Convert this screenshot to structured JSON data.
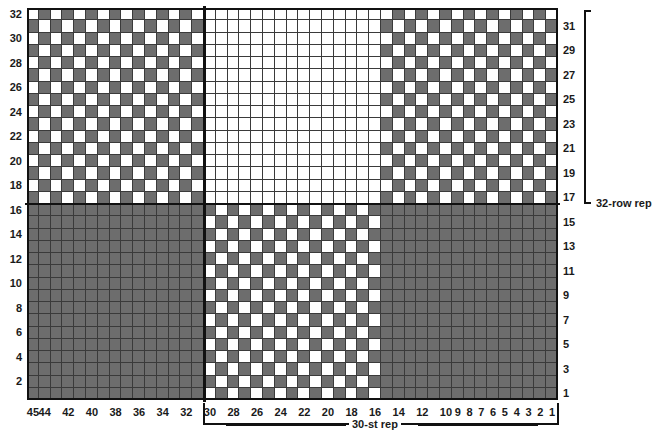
{
  "chart_data": {
    "type": "heatmap",
    "title": "",
    "xlabel": "",
    "ylabel": "",
    "rows": 32,
    "columns": 45,
    "colors": {
      "light": "#ffffff",
      "dark": "#6d6d6d",
      "grid_line": "#3a3a3a",
      "frame": "#111111"
    },
    "legend": [
      {
        "key": "light",
        "label": "background color",
        "color": "#ffffff"
      },
      {
        "key": "dark",
        "label": "contrast color",
        "color": "#6d6d6d"
      }
    ],
    "row_labels_left": [
      "32",
      "30",
      "28",
      "26",
      "24",
      "22",
      "20",
      "18",
      "16",
      "14",
      "12",
      "10",
      "8",
      "6",
      "4",
      "2"
    ],
    "row_labels_right": [
      "31",
      "29",
      "27",
      "25",
      "23",
      "21",
      "19",
      "17",
      "15",
      "13",
      "11",
      "9",
      "7",
      "5",
      "3",
      "1"
    ],
    "column_labels": [
      "45",
      "44",
      "42",
      "40",
      "38",
      "36",
      "34",
      "32",
      "30",
      "28",
      "26",
      "24",
      "22",
      "20",
      "18",
      "16",
      "14",
      "12",
      "10",
      "9",
      "8",
      "7",
      "6",
      "5",
      "4",
      "3",
      "2",
      "1"
    ],
    "column_label_stitches": [
      45,
      44,
      42,
      40,
      38,
      36,
      34,
      32,
      30,
      28,
      26,
      24,
      22,
      20,
      18,
      16,
      14,
      12,
      10,
      9,
      8,
      7,
      6,
      5,
      4,
      3,
      2,
      1
    ],
    "blocks": [
      {
        "name": "top-left-checker",
        "rows": [
          17,
          32
        ],
        "stitches": [
          31,
          45
        ],
        "fill": "checker"
      },
      {
        "name": "top-middle-blank",
        "rows": [
          17,
          32
        ],
        "stitches": [
          16,
          30
        ],
        "fill": "light"
      },
      {
        "name": "top-right-checker",
        "rows": [
          17,
          32
        ],
        "stitches": [
          1,
          15
        ],
        "fill": "checker"
      },
      {
        "name": "bottom-left-solid",
        "rows": [
          1,
          16
        ],
        "stitches": [
          31,
          45
        ],
        "fill": "dark"
      },
      {
        "name": "bottom-middle-checker",
        "rows": [
          1,
          16
        ],
        "stitches": [
          16,
          30
        ],
        "fill": "checker"
      },
      {
        "name": "bottom-right-solid",
        "rows": [
          1,
          16
        ],
        "stitches": [
          1,
          15
        ],
        "fill": "dark"
      }
    ],
    "dividers": {
      "vertical_after_stitch": 30,
      "horizontal_after_row": 16
    },
    "annotations": {
      "row_repeat": "32-row rep",
      "stitch_repeat": "30-st rep"
    }
  },
  "chart": {
    "row_repeat_label": "32-row rep",
    "stitch_repeat_label": "30-st rep"
  }
}
